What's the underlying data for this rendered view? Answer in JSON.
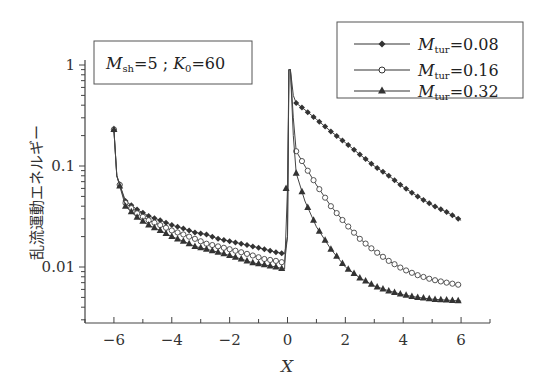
{
  "chart_data": {
    "type": "line",
    "title": "",
    "annotation": "M_sh=5 ; K_0=60",
    "annotation_parts": {
      "m": "M",
      "m_sub": "sh",
      "m_val": "=5 ; ",
      "k": "K",
      "k_sub": "0",
      "k_val": "=60"
    },
    "xlabel": "X",
    "ylabel": "乱流運動エネルギー",
    "xlim": [
      -7,
      7
    ],
    "ylim": [
      0.003,
      1
    ],
    "yscale": "log",
    "xticks": [
      -6,
      -4,
      -2,
      0,
      2,
      4,
      6
    ],
    "xtick_labels": [
      "−6",
      "−4",
      "−2",
      "0",
      "2",
      "4",
      "6"
    ],
    "yticks": [
      0.01,
      0.1,
      1
    ],
    "ytick_labels": [
      "0.01",
      "0.1",
      "1"
    ],
    "grid": false,
    "legend_position": "upper right",
    "series": [
      {
        "name": "M_tur=0.08",
        "legend_label": {
          "m": "M",
          "sub": "tur",
          "val": "=0.08"
        },
        "marker": "filled-diamond",
        "x": [
          -6.0,
          -5.9,
          -5.6,
          -5.2,
          -4.8,
          -4.4,
          -4.0,
          -3.6,
          -3.2,
          -2.8,
          -2.4,
          -2.0,
          -1.6,
          -1.2,
          -0.8,
          -0.4,
          -0.1,
          0.0,
          0.05,
          0.1,
          0.2,
          0.3,
          0.6,
          1.0,
          1.5,
          2.0,
          2.5,
          3.0,
          3.5,
          4.0,
          4.5,
          5.0,
          5.5,
          6.0
        ],
        "values": [
          0.23,
          0.08,
          0.045,
          0.037,
          0.032,
          0.029,
          0.026,
          0.024,
          0.022,
          0.021,
          0.019,
          0.018,
          0.017,
          0.016,
          0.015,
          0.014,
          0.0135,
          0.02,
          0.9,
          0.9,
          0.5,
          0.42,
          0.36,
          0.29,
          0.22,
          0.17,
          0.13,
          0.1,
          0.08,
          0.062,
          0.05,
          0.041,
          0.035,
          0.029
        ]
      },
      {
        "name": "M_tur=0.16",
        "legend_label": {
          "m": "M",
          "sub": "tur",
          "val": "=0.16"
        },
        "marker": "open-circle",
        "x": [
          -6.0,
          -5.9,
          -5.6,
          -5.2,
          -4.8,
          -4.4,
          -4.0,
          -3.6,
          -3.2,
          -2.8,
          -2.4,
          -2.0,
          -1.6,
          -1.2,
          -0.8,
          -0.4,
          -0.1,
          0.0,
          0.05,
          0.1,
          0.2,
          0.3,
          0.6,
          1.0,
          1.5,
          2.0,
          2.5,
          3.0,
          3.5,
          4.0,
          4.5,
          5.0,
          5.5,
          6.0
        ],
        "values": [
          0.23,
          0.08,
          0.043,
          0.034,
          0.029,
          0.026,
          0.023,
          0.021,
          0.019,
          0.017,
          0.016,
          0.015,
          0.014,
          0.013,
          0.012,
          0.0115,
          0.011,
          0.02,
          0.9,
          0.9,
          0.3,
          0.14,
          0.1,
          0.065,
          0.04,
          0.027,
          0.019,
          0.0145,
          0.0115,
          0.0095,
          0.0083,
          0.0075,
          0.007,
          0.0066
        ]
      },
      {
        "name": "M_tur=0.32",
        "legend_label": {
          "m": "M",
          "sub": "tur",
          "val": "=0.32"
        },
        "marker": "filled-triangle",
        "x": [
          -6.0,
          -5.9,
          -5.6,
          -5.2,
          -4.8,
          -4.4,
          -4.0,
          -3.6,
          -3.2,
          -2.8,
          -2.4,
          -2.0,
          -1.6,
          -1.2,
          -0.8,
          -0.4,
          -0.1,
          0.0,
          0.05,
          0.1,
          0.2,
          0.3,
          0.6,
          1.0,
          1.5,
          2.0,
          2.5,
          3.0,
          3.5,
          4.0,
          4.5,
          5.0,
          5.5,
          6.0
        ],
        "values": [
          0.23,
          0.08,
          0.04,
          0.031,
          0.026,
          0.023,
          0.02,
          0.018,
          0.016,
          0.015,
          0.014,
          0.013,
          0.012,
          0.011,
          0.0105,
          0.01,
          0.0095,
          0.06,
          0.9,
          0.9,
          0.2,
          0.085,
          0.045,
          0.025,
          0.015,
          0.01,
          0.0078,
          0.0065,
          0.0058,
          0.0053,
          0.005,
          0.0048,
          0.0047,
          0.0046
        ]
      }
    ]
  }
}
